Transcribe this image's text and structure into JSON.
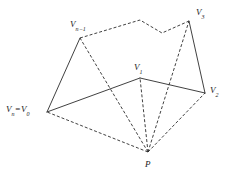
{
  "figure": {
    "type": "geometry-diagram",
    "background_color": "#ffffff",
    "stroke_color": "#2b2b2b",
    "dash_pattern": "3,2",
    "stroke_width": 0.9,
    "canvas": {
      "width": 237,
      "height": 176
    },
    "labels": [
      {
        "name": "v-n-minus-1",
        "base": "V",
        "sub": "n−1",
        "x": 70,
        "y": 20,
        "anchor": "left"
      },
      {
        "name": "v-3",
        "base": "V",
        "sub": "3",
        "x": 196,
        "y": 8,
        "anchor": "left"
      },
      {
        "name": "v-1",
        "base": "V",
        "sub": "1",
        "x": 134,
        "y": 63,
        "anchor": "left"
      },
      {
        "name": "v-2",
        "base": "V",
        "sub": "2",
        "x": 210,
        "y": 86,
        "anchor": "left"
      },
      {
        "name": "v-0",
        "base": "V",
        "sub": "n",
        "eq": "=",
        "base2": "V",
        "sub2": "0",
        "x": 6,
        "y": 105,
        "anchor": "left"
      },
      {
        "name": "p",
        "base": "P",
        "sub": "",
        "x": 145,
        "y": 160,
        "anchor": "left"
      }
    ],
    "vertices": [
      {
        "name": "V0",
        "label": "Vn = V0",
        "x": 47,
        "y": 112
      },
      {
        "name": "V1",
        "label": "V1",
        "x": 140,
        "y": 78
      },
      {
        "name": "V2",
        "label": "V2",
        "x": 205,
        "y": 93
      },
      {
        "name": "V3",
        "label": "V3",
        "x": 189,
        "y": 21
      },
      {
        "name": "Vk1",
        "label": "",
        "x": 162,
        "y": 33
      },
      {
        "name": "Vk2",
        "label": "",
        "x": 140,
        "y": 20
      },
      {
        "name": "Vn1",
        "label": "V(n-1)",
        "x": 80,
        "y": 38
      },
      {
        "name": "P",
        "label": "P",
        "x": 148,
        "y": 152
      }
    ],
    "solid_edges": [
      {
        "name": "edge-v0-vn1",
        "from": "V0",
        "to": "Vn1"
      },
      {
        "name": "edge-v0-v1",
        "from": "V0",
        "to": "V1"
      },
      {
        "name": "edge-v1-v2",
        "from": "V1",
        "to": "V2"
      },
      {
        "name": "edge-v2-v3",
        "from": "V2",
        "to": "V3"
      }
    ],
    "dashed_edges": [
      {
        "name": "edge-vn1-vk2",
        "from": "Vn1",
        "to": "Vk2"
      },
      {
        "name": "edge-vk2-vk1",
        "from": "Vk2",
        "to": "Vk1"
      },
      {
        "name": "edge-vk1-v3",
        "from": "Vk1",
        "to": "V3"
      }
    ],
    "dashed_rays": [
      {
        "name": "ray-p-v0",
        "from": "P",
        "to": "V0"
      },
      {
        "name": "ray-p-vn1",
        "from": "P",
        "to": "Vn1"
      },
      {
        "name": "ray-p-v1",
        "from": "P",
        "to": "V1"
      },
      {
        "name": "ray-p-v3",
        "from": "P",
        "to": "V3"
      },
      {
        "name": "ray-p-v2",
        "from": "P",
        "to": "V2"
      }
    ]
  }
}
